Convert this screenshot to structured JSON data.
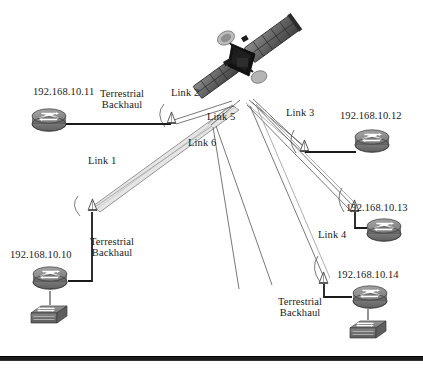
{
  "figure": {
    "width": 423,
    "height": 370,
    "background": "#ffffff",
    "rule_color": "#1c1c1c",
    "rule_y": 356
  },
  "satellite": {
    "name": "communications-satellite",
    "x": 243,
    "y": 60,
    "body_color": "#1a1a1a",
    "panel_color": "#6e6e6e"
  },
  "routers": [
    {
      "id": "r11",
      "ip": "192.168.10.11",
      "x": 50,
      "y": 119,
      "label_x": 33,
      "label_y": 89,
      "label_align": "left"
    },
    {
      "id": "r12",
      "ip": "192.168.10.12",
      "x": 370,
      "y": 140,
      "label_x": 340,
      "label_y": 113,
      "label_align": "left"
    },
    {
      "id": "r13",
      "ip": "192.168.10.13",
      "x": 382,
      "y": 230,
      "label_x": 346,
      "label_y": 205,
      "label_align": "left"
    },
    {
      "id": "r14",
      "ip": "192.168.10.14",
      "x": 368,
      "y": 296,
      "label_x": 337,
      "label_y": 272,
      "label_align": "left"
    },
    {
      "id": "r10",
      "ip": "192.168.10.10",
      "x": 50,
      "y": 277,
      "label_x": 10,
      "label_y": 252,
      "label_align": "left"
    }
  ],
  "switches": [
    {
      "id": "sw10",
      "x": 50,
      "y": 313,
      "attached_router": "r10"
    },
    {
      "id": "sw14",
      "x": 368,
      "y": 327,
      "attached_router": "r14"
    }
  ],
  "antennas": [
    {
      "id": "a2",
      "link": "Link 2",
      "x": 171,
      "y": 122
    },
    {
      "id": "a3",
      "link": "Link 3",
      "x": 303,
      "y": 148
    },
    {
      "id": "a4",
      "link": "Link 4",
      "x": 354,
      "y": 210
    },
    {
      "id": "a14",
      "link": "Link 4b",
      "x": 323,
      "y": 281
    },
    {
      "id": "a1",
      "link": "Link 1",
      "x": 92,
      "y": 209
    }
  ],
  "link_labels": [
    {
      "text": "Link 1",
      "x": 88,
      "y": 160
    },
    {
      "text": "Link 2",
      "x": 171,
      "y": 90
    },
    {
      "text": "Link 3",
      "x": 286,
      "y": 110
    },
    {
      "text": "Link 4",
      "x": 318,
      "y": 232
    },
    {
      "text": "Link 5",
      "x": 207,
      "y": 114
    },
    {
      "text": "Link 6",
      "x": 188,
      "y": 140
    }
  ],
  "backhaul_labels": [
    {
      "text": "Terrestrial\nBackhaul",
      "x": 103,
      "y": 91
    },
    {
      "text": "Terrestrial\nBackhaul",
      "x": 92,
      "y": 239
    },
    {
      "text": "Terrestrial\nBackhaul",
      "x": 281,
      "y": 299
    }
  ],
  "colors": {
    "device_fill": "#8a8a8a",
    "device_fill_dark": "#6b6b6b",
    "device_stroke": "#3a3a3a",
    "beam_stroke": "#555555",
    "wire_stroke": "#1a1a1a",
    "text": "#1a1a1a"
  }
}
